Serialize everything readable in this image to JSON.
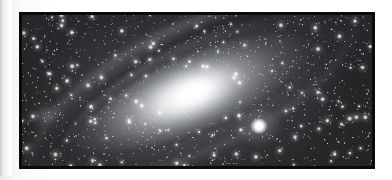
{
  "page": {
    "background_color": "#ffffff",
    "left_edge_strip_color": "#c9c9c9"
  },
  "photo": {
    "alt_title": "Andromeda Galaxy (M31) wide-field photograph",
    "subject": "spiral galaxy with companion",
    "frame_border_color": "#0b0b0b",
    "frame_border_width_px": 3,
    "sky_background_color": "#1d1e20",
    "star_color": "#ffffff",
    "galaxy_core_color": "#ffffff",
    "dust_lane_color": "#18191c",
    "rendering": {
      "type": "photograph",
      "palette": "grayscale",
      "galaxy_rotation_deg": -22,
      "core_center_pct": {
        "x": 47,
        "y": 52
      },
      "companion_center_px": {
        "x": 237,
        "y": 111
      },
      "star_count": 1450,
      "bright_star_count": 120
    }
  }
}
